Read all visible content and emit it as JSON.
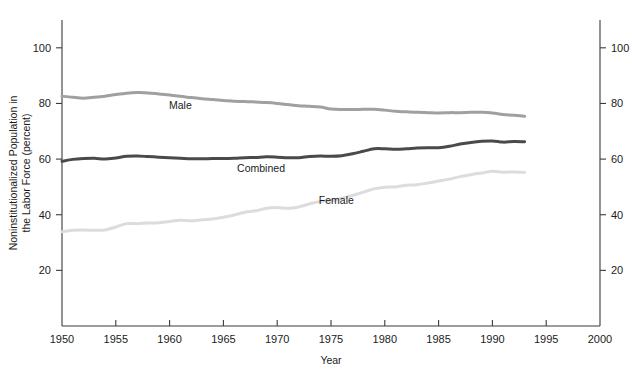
{
  "chart_data": {
    "type": "line",
    "title": "",
    "xlabel": "Year",
    "ylabel": "Noninstitutionalized Population in the Labor Force (percent)",
    "ylabel_line1": "Noninstitutionalized Population in",
    "ylabel_line2": "the Labor Force (percent)",
    "xlim": [
      1950,
      2000
    ],
    "ylim": [
      0,
      110
    ],
    "xticks": [
      1950,
      1955,
      1960,
      1965,
      1970,
      1975,
      1980,
      1985,
      1990,
      1995,
      2000
    ],
    "xtick_labels": [
      "1950",
      "1955",
      "1960",
      "1965",
      "1970",
      "1975",
      "1980",
      "1985",
      "1990",
      "1995",
      "2000"
    ],
    "yticks": [
      20,
      40,
      60,
      80,
      100
    ],
    "ytick_labels": [
      "20",
      "40",
      "60",
      "80",
      "100"
    ],
    "right_ytick_labels": [
      "20",
      "40",
      "60",
      "80",
      "100"
    ],
    "grid": false,
    "legend_position": "inline-annotations",
    "series": [
      {
        "name": "Male",
        "color": "#a0a0a0",
        "label_text": "Male",
        "label_x": 1961.0,
        "label_y": 78.0,
        "x": [
          1950,
          1951,
          1952,
          1953,
          1954,
          1955,
          1956,
          1957,
          1958,
          1959,
          1960,
          1961,
          1962,
          1963,
          1964,
          1965,
          1966,
          1967,
          1968,
          1969,
          1970,
          1971,
          1972,
          1973,
          1974,
          1975,
          1976,
          1977,
          1978,
          1979,
          1980,
          1981,
          1982,
          1983,
          1984,
          1985,
          1986,
          1987,
          1988,
          1989,
          1990,
          1991,
          1992,
          1993
        ],
        "values": [
          82.6,
          82.2,
          81.9,
          82.2,
          82.6,
          83.2,
          83.7,
          83.9,
          83.8,
          83.4,
          83.0,
          82.6,
          82.1,
          81.7,
          81.4,
          81.1,
          80.8,
          80.7,
          80.5,
          80.3,
          80.0,
          79.6,
          79.2,
          79.0,
          78.7,
          78.0,
          77.8,
          77.8,
          77.9,
          77.9,
          77.6,
          77.2,
          77.0,
          76.8,
          76.7,
          76.6,
          76.7,
          76.7,
          76.8,
          76.8,
          76.6,
          76.0,
          75.8,
          75.4
        ]
      },
      {
        "name": "Combined",
        "color": "#4a4a4a",
        "label_text": "Combined",
        "label_x": 1968.5,
        "label_y": 55.5,
        "x": [
          1950,
          1951,
          1952,
          1953,
          1954,
          1955,
          1956,
          1957,
          1958,
          1959,
          1960,
          1961,
          1962,
          1963,
          1964,
          1965,
          1966,
          1967,
          1968,
          1969,
          1970,
          1971,
          1972,
          1973,
          1974,
          1975,
          1976,
          1977,
          1978,
          1979,
          1980,
          1981,
          1982,
          1983,
          1984,
          1985,
          1986,
          1987,
          1988,
          1989,
          1990,
          1991,
          1992,
          1993
        ],
        "values": [
          59.2,
          59.9,
          60.2,
          60.3,
          60.0,
          60.4,
          61.0,
          61.1,
          60.9,
          60.7,
          60.5,
          60.3,
          60.1,
          60.1,
          60.2,
          60.2,
          60.3,
          60.5,
          60.6,
          60.8,
          60.7,
          60.5,
          60.5,
          60.9,
          61.1,
          61.0,
          61.2,
          61.9,
          62.8,
          63.7,
          63.7,
          63.5,
          63.7,
          64.0,
          64.1,
          64.1,
          64.6,
          65.4,
          66.0,
          66.4,
          66.5,
          66.1,
          66.3,
          66.2
        ]
      },
      {
        "name": "Female",
        "color": "#dcdcdc",
        "label_text": "Female",
        "label_x": 1975.5,
        "label_y": 44.0,
        "x": [
          1950,
          1951,
          1952,
          1953,
          1954,
          1955,
          1956,
          1957,
          1958,
          1959,
          1960,
          1961,
          1962,
          1963,
          1964,
          1965,
          1966,
          1967,
          1968,
          1969,
          1970,
          1971,
          1972,
          1973,
          1974,
          1975,
          1976,
          1977,
          1978,
          1979,
          1980,
          1981,
          1982,
          1983,
          1984,
          1985,
          1986,
          1987,
          1988,
          1989,
          1990,
          1991,
          1992,
          1993
        ],
        "values": [
          33.9,
          34.4,
          34.5,
          34.4,
          34.5,
          35.6,
          36.8,
          36.8,
          37.0,
          37.1,
          37.6,
          38.0,
          37.8,
          38.2,
          38.5,
          39.1,
          39.9,
          40.9,
          41.4,
          42.3,
          42.6,
          42.3,
          42.8,
          43.9,
          44.8,
          45.0,
          45.9,
          46.9,
          48.1,
          49.3,
          49.9,
          50.0,
          50.6,
          50.8,
          51.4,
          52.1,
          52.8,
          53.7,
          54.4,
          55.0,
          55.6,
          55.3,
          55.4,
          55.2
        ]
      }
    ]
  }
}
